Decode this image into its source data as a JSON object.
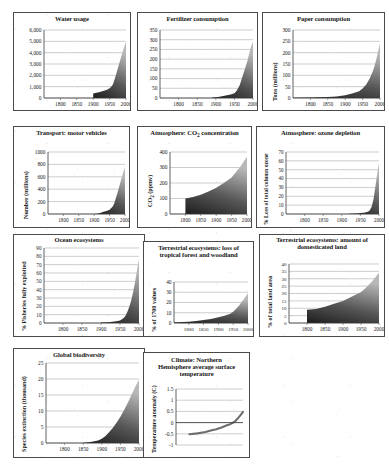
{
  "figure": {
    "name": "great-acceleration-indicator-panels",
    "panel_count": 11,
    "shared_xlabel": "",
    "shared_xticks": [
      "1800",
      "1850",
      "1900",
      "1950",
      "2000"
    ]
  },
  "chart_data": [
    {
      "id": "water-usage",
      "type": "area",
      "title": "Water usage",
      "xlabel": "",
      "ylabel": "",
      "xlim": [
        1750,
        2000
      ],
      "ylim": [
        0,
        6000
      ],
      "yticks": [
        "0",
        "1,000",
        "2,000",
        "3,000",
        "4,000",
        "5,000",
        "6,000"
      ],
      "xticks": [
        "1800",
        "1850",
        "1900",
        "1950",
        "2000"
      ],
      "grid": true,
      "x": [
        1900,
        1910,
        1920,
        1930,
        1940,
        1950,
        1955,
        1960,
        1965,
        1970,
        1975,
        1980,
        1985,
        1990,
        1995,
        2000
      ],
      "values": [
        400,
        460,
        530,
        610,
        700,
        850,
        1000,
        1200,
        1600,
        2100,
        2600,
        3100,
        3600,
        4100,
        4550,
        4950
      ]
    },
    {
      "id": "fertilizer-consumption",
      "type": "area",
      "title": "Fertilizer consumption",
      "xlabel": "",
      "ylabel": "",
      "xlim": [
        1750,
        2000
      ],
      "ylim": [
        0,
        350
      ],
      "yticks": [
        "0",
        "50",
        "100",
        "150",
        "200",
        "250",
        "300",
        "350"
      ],
      "xticks": [
        "1800",
        "1850",
        "1900",
        "1950",
        "2000"
      ],
      "grid": true,
      "x": [
        1890,
        1900,
        1910,
        1920,
        1930,
        1940,
        1950,
        1955,
        1960,
        1965,
        1970,
        1975,
        1980,
        1985,
        1990,
        1995,
        2000
      ],
      "values": [
        2,
        4,
        7,
        10,
        14,
        18,
        25,
        35,
        50,
        70,
        100,
        130,
        160,
        190,
        230,
        265,
        288
      ]
    },
    {
      "id": "paper-consumption",
      "type": "area",
      "title": "Paper consumption",
      "xlabel": "",
      "ylabel": "Tons (millions)",
      "xlim": [
        1750,
        2000
      ],
      "ylim": [
        0,
        300
      ],
      "yticks": [
        "0",
        "50",
        "100",
        "150",
        "200",
        "250",
        "300"
      ],
      "xticks": [
        "1800",
        "1850",
        "1900",
        "1950",
        "2000"
      ],
      "grid": true,
      "x": [
        1750,
        1800,
        1850,
        1875,
        1900,
        1920,
        1940,
        1950,
        1960,
        1970,
        1980,
        1985,
        1990,
        1995,
        2000
      ],
      "values": [
        1,
        2,
        4,
        7,
        12,
        20,
        30,
        42,
        58,
        85,
        120,
        145,
        175,
        210,
        240
      ]
    },
    {
      "id": "transport-motor-vehicles",
      "type": "area",
      "title": "Transport: motor vehicles",
      "xlabel": "",
      "ylabel": "Number (millions)",
      "xlim": [
        1750,
        2000
      ],
      "ylim": [
        0,
        1000
      ],
      "yticks": [
        "0",
        "200",
        "400",
        "600",
        "800",
        "1000"
      ],
      "xticks": [
        "1800",
        "1850",
        "1900",
        "1950",
        "2000"
      ],
      "grid": true,
      "x": [
        1900,
        1910,
        1920,
        1930,
        1940,
        1950,
        1960,
        1965,
        1970,
        1975,
        1980,
        1985,
        1990,
        1995,
        2000
      ],
      "values": [
        1,
        5,
        15,
        35,
        50,
        70,
        120,
        170,
        250,
        330,
        420,
        510,
        600,
        680,
        760
      ]
    },
    {
      "id": "atmosphere-co2-concentration",
      "type": "area",
      "title": "Atmosphere: CO2 concentration",
      "title_parts": [
        "Atmosphere: CO",
        "2",
        " concentration"
      ],
      "xlabel": "",
      "ylabel": "CO2 (ppmv)",
      "ylabel_parts": [
        "CO",
        "2",
        " (ppmv)"
      ],
      "xlim": [
        1750,
        2000
      ],
      "ylim": [
        0,
        400
      ],
      "yticks": [
        "0",
        "100",
        "200",
        "300",
        "400"
      ],
      "xticks": [
        "1800",
        "1850",
        "1900",
        "1950",
        "2000"
      ],
      "grid": true,
      "x": [
        1800,
        1825,
        1850,
        1875,
        1900,
        1925,
        1950,
        1960,
        1970,
        1980,
        1990,
        2000
      ],
      "values": [
        100,
        110,
        125,
        145,
        170,
        200,
        235,
        260,
        285,
        310,
        340,
        370
      ]
    },
    {
      "id": "atmosphere-ozone-depletion",
      "type": "area",
      "title": "Atmosphere: ozone depletion",
      "xlabel": "",
      "ylabel": "% Loss of total column ozone",
      "xlim": [
        1750,
        2000
      ],
      "ylim": [
        0,
        70
      ],
      "yticks": [
        "0",
        "10",
        "20",
        "30",
        "40",
        "50",
        "60",
        "70"
      ],
      "xticks": [
        "1800",
        "1850",
        "1900",
        "1950",
        "2000"
      ],
      "grid": true,
      "x": [
        1920,
        1940,
        1950,
        1960,
        1970,
        1975,
        1980,
        1985,
        1990,
        1995,
        2000
      ],
      "values": [
        0.3,
        0.6,
        1,
        1.5,
        2.5,
        4,
        8,
        16,
        30,
        45,
        58
      ]
    },
    {
      "id": "ocean-ecosystems",
      "type": "area",
      "title": "Ocean ecosystems",
      "xlabel": "",
      "ylabel": "% Fisheries fully exploited",
      "xlim": [
        1750,
        2000
      ],
      "ylim": [
        0,
        90
      ],
      "yticks": [
        "0",
        "10",
        "20",
        "30",
        "40",
        "50",
        "60",
        "70",
        "80",
        "90"
      ],
      "xticks": [
        "1800",
        "1850",
        "1900",
        "1950",
        "2000"
      ],
      "grid": true,
      "x": [
        1900,
        1920,
        1940,
        1950,
        1960,
        1965,
        1970,
        1975,
        1980,
        1985,
        1990,
        1995,
        2000
      ],
      "values": [
        0.5,
        1,
        2,
        3,
        6,
        9,
        14,
        20,
        28,
        38,
        50,
        64,
        77
      ]
    },
    {
      "id": "terrestrial-loss-tropical-forest",
      "type": "area",
      "title": "Terrestrial ecosystems: loss of tropical forest and woodland",
      "xlabel": "",
      "ylabel": "% of 1700 values",
      "xlim": [
        1750,
        2000
      ],
      "ylim": [
        0,
        40
      ],
      "yticks": [
        "0",
        "10",
        "20",
        "30",
        "40"
      ],
      "xticks": [
        "1800",
        "1850",
        "1900",
        "1950",
        "2000"
      ],
      "grid": true,
      "x": [
        1750,
        1800,
        1825,
        1850,
        1875,
        1900,
        1920,
        1940,
        1950,
        1960,
        1970,
        1980,
        1990,
        2000
      ],
      "values": [
        0.5,
        1.2,
        2,
        3,
        4,
        5.5,
        7,
        9,
        11,
        14,
        17,
        21,
        25,
        29
      ]
    },
    {
      "id": "terrestrial-domesticated-land",
      "type": "area",
      "title": "Terrestrial ecosystems: amount of domesticated land",
      "xlabel": "",
      "ylabel": "% of total land area",
      "xlim": [
        1750,
        2000
      ],
      "ylim": [
        0,
        40
      ],
      "yticks": [
        "0",
        "5",
        "10",
        "15",
        "20",
        "25",
        "30",
        "35",
        "40"
      ],
      "xticks": [
        "1800",
        "1850",
        "1900",
        "1950",
        "2000"
      ],
      "grid": true,
      "x": [
        1800,
        1825,
        1850,
        1875,
        1900,
        1925,
        1950,
        1960,
        1970,
        1980,
        1990,
        2000
      ],
      "values": [
        9,
        9.5,
        11,
        13,
        15,
        18,
        21,
        23,
        25.5,
        28,
        31,
        34
      ]
    },
    {
      "id": "global-biodiversity",
      "type": "area",
      "title": "Global biodiversity",
      "xlabel": "",
      "ylabel": "Species extinction (thousand)",
      "xlim": [
        1750,
        2000
      ],
      "ylim": [
        0,
        25
      ],
      "yticks": [
        "0",
        "5",
        "10",
        "15",
        "20",
        "25"
      ],
      "xticks": [
        "1800",
        "1850",
        "1900",
        "1950",
        "2000"
      ],
      "grid": true,
      "x": [
        1850,
        1870,
        1890,
        1900,
        1910,
        1920,
        1930,
        1940,
        1950,
        1960,
        1970,
        1980,
        1990,
        2000
      ],
      "values": [
        0.1,
        0.3,
        0.8,
        1.3,
        2.2,
        3.4,
        4.8,
        6.4,
        8.2,
        10.3,
        12.6,
        15.1,
        17.6,
        19.8
      ]
    },
    {
      "id": "climate-nh-surface-temperature",
      "type": "line",
      "title": "Climate: Northern Hemisphere average surface temperature",
      "xlabel": "",
      "ylabel": "Temperature anomaly (C)",
      "xlim": [
        1750,
        2000
      ],
      "ylim": [
        -1,
        1.5
      ],
      "yticks": [
        "-1",
        "-0.5",
        "0",
        "0.5",
        "1",
        "1.5"
      ],
      "xticks": [],
      "grid": true,
      "x": [
        1800,
        1830,
        1860,
        1880,
        1900,
        1920,
        1940,
        1950,
        1960,
        1970,
        1980,
        1990,
        2000
      ],
      "values": [
        -0.52,
        -0.48,
        -0.42,
        -0.35,
        -0.3,
        -0.22,
        -0.12,
        -0.08,
        -0.02,
        0.05,
        0.18,
        0.32,
        0.48
      ]
    }
  ]
}
